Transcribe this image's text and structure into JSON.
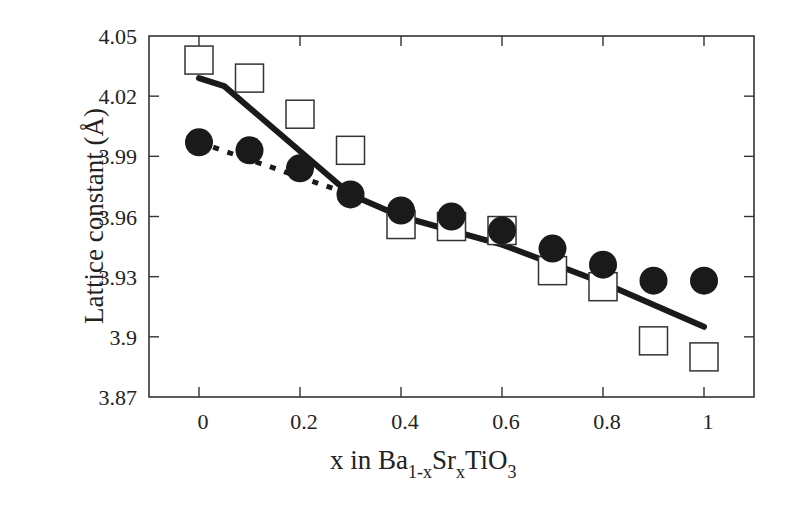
{
  "chart_data": {
    "type": "scatter",
    "title": "",
    "xlabel": "x in Ba1-xSrxTiO3",
    "xlabel_parts": {
      "main1": "x in Ba",
      "sub1": "1-x",
      "main2": "Sr",
      "sub2": "x",
      "main3": "TiO",
      "sub3": "3"
    },
    "ylabel": "Lattice constant (Å)",
    "xlim": [
      -0.1,
      1.1
    ],
    "ylim": [
      3.87,
      4.05
    ],
    "xticks": [
      "0",
      "0.2",
      "0.4",
      "0.6",
      "0.8",
      "1"
    ],
    "xtick_values": [
      0,
      0.2,
      0.4,
      0.6,
      0.8,
      1.0
    ],
    "yticks": [
      "4.05",
      "4.02",
      "3.99",
      "3.96",
      "3.93",
      "3.9",
      "3.87"
    ],
    "ytick_values": [
      4.05,
      4.02,
      3.99,
      3.96,
      3.93,
      3.9,
      3.87
    ],
    "grid": false,
    "legend": null,
    "x": [
      0,
      0.1,
      0.2,
      0.3,
      0.4,
      0.5,
      0.6,
      0.7,
      0.8,
      0.9,
      1.0
    ],
    "series": [
      {
        "name": "open squares",
        "marker": "open-square",
        "values": [
          4.038,
          4.029,
          4.011,
          3.993,
          3.956,
          3.955,
          3.953,
          3.933,
          3.925,
          3.898,
          3.89
        ]
      },
      {
        "name": "filled circles",
        "marker": "filled-circle",
        "values": [
          3.997,
          3.993,
          3.984,
          3.971,
          3.963,
          3.96,
          3.953,
          3.944,
          3.936,
          3.928,
          3.928
        ]
      },
      {
        "name": "solid line",
        "style": "solid",
        "x": [
          0,
          0.05,
          0.3,
          0.4,
          0.6,
          0.8,
          1.0
        ],
        "values": [
          4.029,
          4.025,
          3.971,
          3.96,
          3.946,
          3.927,
          3.905
        ]
      },
      {
        "name": "dotted line",
        "style": "dotted",
        "x": [
          0,
          0.3
        ],
        "values": [
          3.997,
          3.971
        ]
      }
    ]
  }
}
